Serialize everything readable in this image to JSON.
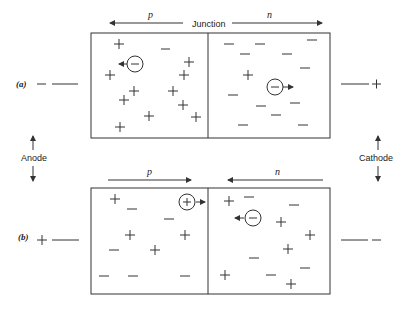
{
  "diagram": {
    "top_labels": {
      "p": "p",
      "junction": "Junction",
      "n": "n"
    },
    "side_labels": {
      "anode": "Anode",
      "cathode": "Cathode"
    },
    "panel_a": {
      "tag": "(a)",
      "left_terminal": "−",
      "right_terminal": "+",
      "p": "p",
      "n": "n"
    },
    "panel_b": {
      "tag": "(b)",
      "left_terminal": "+",
      "right_terminal": "−",
      "p": "p",
      "n": "n"
    },
    "colors": {
      "ink": "#333333",
      "background": "#ffffff"
    }
  }
}
